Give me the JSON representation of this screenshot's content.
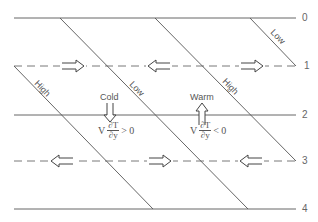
{
  "diagram": {
    "levels": [
      {
        "label": "0",
        "y": 18,
        "style": "solid"
      },
      {
        "label": "1",
        "y": 66,
        "style": "dashed"
      },
      {
        "label": "2",
        "y": 115,
        "style": "solid"
      },
      {
        "label": "3",
        "y": 161,
        "style": "dashed"
      },
      {
        "label": "4",
        "y": 209,
        "style": "solid"
      }
    ],
    "diagonals": [
      {
        "name": "high-left",
        "from": [
          14,
          66
        ],
        "to": [
          153,
          209
        ],
        "label": "High"
      },
      {
        "name": "low-center",
        "from": [
          60,
          18
        ],
        "to": [
          248,
          209
        ],
        "label": "Low"
      },
      {
        "name": "high-right",
        "from": [
          155,
          18
        ],
        "to": [
          296,
          161
        ],
        "label": "High"
      },
      {
        "name": "low-right",
        "from": [
          250,
          18
        ],
        "to": [
          296,
          66
        ],
        "label": "Low"
      }
    ],
    "horizontal_arrows": [
      {
        "level": "1",
        "x": 80,
        "direction": "right"
      },
      {
        "level": "1",
        "x": 165,
        "direction": "left"
      },
      {
        "level": "1",
        "x": 255,
        "direction": "right"
      },
      {
        "level": "3",
        "x": 62,
        "direction": "left"
      },
      {
        "level": "3",
        "x": 160,
        "direction": "right"
      },
      {
        "level": "3",
        "x": 253,
        "direction": "left"
      }
    ],
    "annotations": {
      "cold": {
        "label": "Cold",
        "arrow": "down",
        "formula": {
          "prefix": "V",
          "numerator": "∂T",
          "denominator": "∂y",
          "relation": "> 0"
        }
      },
      "warm": {
        "label": "Warm",
        "arrow": "up",
        "formula": {
          "prefix": "V",
          "numerator": "∂T",
          "denominator": "∂y",
          "relation": "< 0"
        }
      }
    },
    "line_color": "#555555"
  }
}
